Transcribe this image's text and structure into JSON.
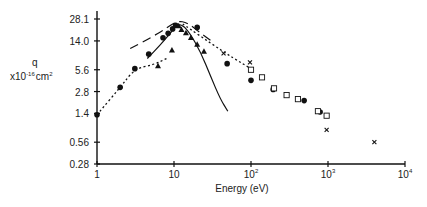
{
  "chart_data": {
    "type": "scatter",
    "title": "",
    "xlabel": "Energy (eV)",
    "ylabel": "q",
    "ylabel_unit": "x10",
    "ylabel_exp": "-16",
    "ylabel_suffix": "cm",
    "ylabel_suffix_exp": "2",
    "xscale": "log",
    "yscale": "log",
    "xlim": [
      1,
      10000
    ],
    "ylim": [
      0.28,
      28.1
    ],
    "grid": false,
    "x_ticks": [
      {
        "value": 1,
        "base": "1",
        "exp": ""
      },
      {
        "value": 10,
        "base": "10",
        "exp": ""
      },
      {
        "value": 100,
        "base": "10",
        "exp": "2"
      },
      {
        "value": 1000,
        "base": "10",
        "exp": "3"
      },
      {
        "value": 10000,
        "base": "10",
        "exp": "4"
      }
    ],
    "y_ticks": [
      {
        "value": 0.28,
        "label": "0.28"
      },
      {
        "value": 0.56,
        "label": "0.56"
      },
      {
        "value": 1.4,
        "label": "1.4"
      },
      {
        "value": 2.8,
        "label": "2.8"
      },
      {
        "value": 5.6,
        "label": "5.6"
      },
      {
        "value": 14.0,
        "label": "14.0"
      },
      {
        "value": 28.1,
        "label": "28.1"
      }
    ],
    "series": [
      {
        "name": "filled-circles",
        "marker": "circle-filled",
        "points": [
          [
            1,
            1.34
          ],
          [
            2.0,
            3.2
          ],
          [
            3.1,
            5.8
          ],
          [
            4.7,
            9.2
          ],
          [
            7.2,
            15.5
          ],
          [
            8.4,
            17.8
          ],
          [
            9.6,
            20.5
          ],
          [
            10.5,
            23.0
          ],
          [
            20,
            21.5
          ],
          [
            49,
            6.8
          ],
          [
            100,
            4.0
          ],
          [
            194,
            3.0
          ],
          [
            490,
            2.1
          ],
          [
            790,
            1.46
          ]
        ]
      },
      {
        "name": "filled-triangles",
        "marker": "triangle-filled",
        "points": [
          [
            6.2,
            6.3
          ],
          [
            9.4,
            10.4
          ],
          [
            11.5,
            22.5
          ],
          [
            12.5,
            20.0
          ],
          [
            14.3,
            18.0
          ],
          [
            16.6,
            15.5
          ],
          [
            20,
            12.5
          ],
          [
            24.5,
            10.0
          ]
        ]
      },
      {
        "name": "open-squares",
        "marker": "square-open",
        "points": [
          [
            100,
            5.6
          ],
          [
            139,
            4.4
          ],
          [
            199,
            3.1
          ],
          [
            290,
            2.5
          ],
          [
            407,
            2.2
          ],
          [
            740,
            1.5
          ],
          [
            960,
            1.3
          ]
        ]
      },
      {
        "name": "crosses",
        "marker": "cross",
        "points": [
          [
            44,
            9.4
          ],
          [
            97,
            7.1
          ],
          [
            960,
            0.83
          ],
          [
            4000,
            0.56
          ]
        ]
      }
    ],
    "curves": [
      {
        "name": "dotted-fit",
        "style": "dotted",
        "points": [
          [
            1,
            1.34
          ],
          [
            2.0,
            3.2
          ],
          [
            3.1,
            5.8
          ],
          [
            5.5,
            6.6
          ],
          [
            8,
            8.0
          ]
        ]
      },
      {
        "name": "dotted-fit-high-energy",
        "style": "dotted",
        "points": [
          [
            13,
            24.0
          ],
          [
            30,
            13.0
          ],
          [
            60,
            8.0
          ],
          [
            100,
            5.8
          ]
        ]
      },
      {
        "name": "solid-theory",
        "style": "solid",
        "points": [
          [
            4.5,
            8.0
          ],
          [
            6.5,
            12.0
          ],
          [
            9,
            18.0
          ],
          [
            11,
            23.5
          ],
          [
            13,
            23.0
          ],
          [
            16,
            18.0
          ],
          [
            22,
            10.0
          ],
          [
            30,
            4.5
          ],
          [
            40,
            2.2
          ],
          [
            50,
            1.5
          ]
        ]
      },
      {
        "name": "long-dash-theory",
        "style": "long-dash",
        "points": [
          [
            2.7,
            11.0
          ],
          [
            5,
            15.5
          ],
          [
            8,
            21.0
          ],
          [
            11,
            26.5
          ],
          [
            15,
            25.0
          ],
          [
            22,
            18.0
          ],
          [
            32,
            13.5
          ]
        ]
      }
    ]
  }
}
